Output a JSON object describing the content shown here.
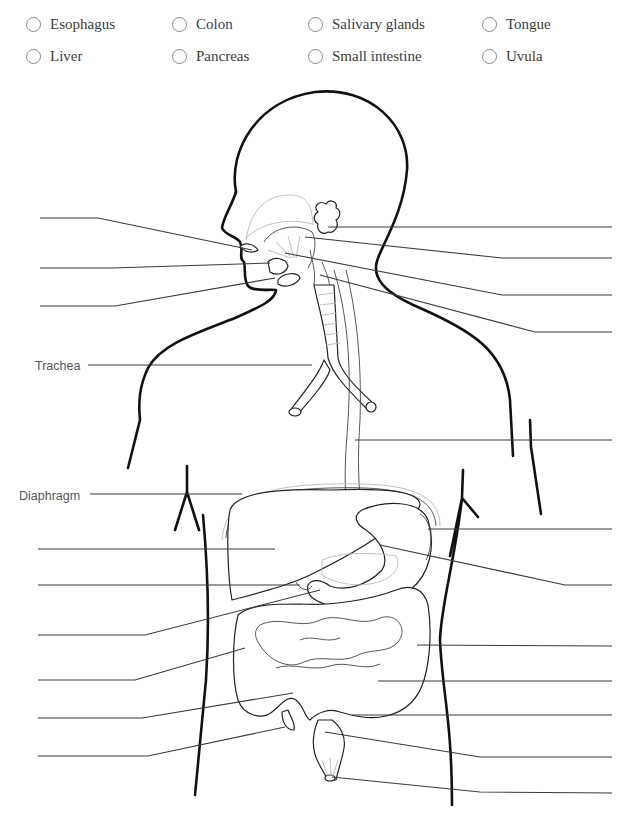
{
  "word_bank": {
    "options": [
      {
        "label": "Esophagus",
        "x": 26,
        "y": 16
      },
      {
        "label": "Colon",
        "x": 172,
        "y": 16
      },
      {
        "label": "Salivary glands",
        "x": 308,
        "y": 16
      },
      {
        "label": "Tongue",
        "x": 482,
        "y": 16
      },
      {
        "label": "Liver",
        "x": 26,
        "y": 48
      },
      {
        "label": "Pancreas",
        "x": 172,
        "y": 48
      },
      {
        "label": "Small intestine",
        "x": 308,
        "y": 48
      },
      {
        "label": "Uvula",
        "x": 482,
        "y": 48
      }
    ]
  },
  "diagram": {
    "given_labels": [
      {
        "text": "Trachea",
        "x": 35,
        "y": 359
      },
      {
        "text": "Diaphragm",
        "x": 19,
        "y": 489
      }
    ],
    "colors": {
      "outline": "#111111",
      "organ_stroke": "#222222",
      "faint_stroke": "#b8b8b8",
      "leader": "#3a3a3a",
      "label_text": "#555555"
    },
    "left_blanks": [
      {
        "id": "L1",
        "points": "40,218 98,218 252,250"
      },
      {
        "id": "L2",
        "points": "40,268 112,268 270,263"
      },
      {
        "id": "L3",
        "points": "40,306 115,306 275,278"
      },
      {
        "id": "L4",
        "points": "38,549 275,549"
      },
      {
        "id": "L5",
        "points": "38,585 300,585"
      },
      {
        "id": "L6",
        "points": "38,635 145,635 320,590"
      },
      {
        "id": "L7",
        "points": "38,680 135,680 245,648"
      },
      {
        "id": "L8",
        "points": "38,718 142,718 293,693"
      },
      {
        "id": "L9",
        "points": "38,756 148,756 285,727"
      }
    ],
    "right_blanks": [
      {
        "id": "R1",
        "points": "328,227 612,227"
      },
      {
        "id": "R2",
        "points": "305,237 502,258 612,258"
      },
      {
        "id": "R3",
        "points": "285,253 502,295 612,295"
      },
      {
        "id": "R4",
        "points": "320,275 535,332 612,332"
      },
      {
        "id": "R5",
        "points": "355,440 612,440"
      },
      {
        "id": "R6",
        "points": "428,529 612,529"
      },
      {
        "id": "R7",
        "points": "380,545 565,585 612,585"
      },
      {
        "id": "R8",
        "points": "417,645 612,646"
      },
      {
        "id": "R9",
        "points": "378,681 612,681"
      },
      {
        "id": "R10",
        "points": "352,715 612,715"
      },
      {
        "id": "R11",
        "points": "325,732 480,757 612,757"
      },
      {
        "id": "R12",
        "points": "332,777 480,792 612,793"
      }
    ],
    "given_leaders": [
      {
        "id": "trachea-line",
        "points": "88,365 312,365"
      },
      {
        "id": "diaphragm-line",
        "points": "90,494 242,494"
      }
    ]
  }
}
